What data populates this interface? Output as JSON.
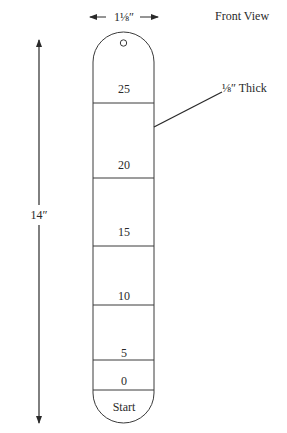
{
  "diagram": {
    "view_title": "Front View",
    "width_dimension": "1⅛″",
    "height_dimension": "14″",
    "thickness_callout": "⅛″ Thick",
    "strip": {
      "hole": true,
      "segments": [
        {
          "label": "25"
        },
        {
          "label": "20"
        },
        {
          "label": "15"
        },
        {
          "label": "10"
        },
        {
          "label": "5"
        },
        {
          "label": "0"
        },
        {
          "label": "Start"
        }
      ]
    },
    "colors": {
      "line": "#3a3a3a",
      "text": "#2a2a2a",
      "background": "#ffffff"
    }
  }
}
